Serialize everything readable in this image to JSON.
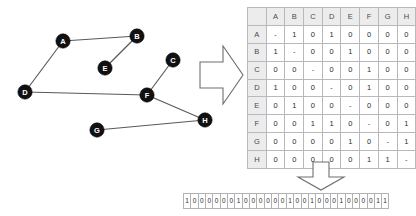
{
  "graph": {
    "title": "undirected-graph",
    "node_fill_color": "#111114",
    "node_label_color": "#ffffff",
    "edge_color": "#59595b",
    "nodes": [
      {
        "id": "A",
        "label": "A",
        "x": 63,
        "y": 41
      },
      {
        "id": "B",
        "label": "B",
        "x": 137,
        "y": 36
      },
      {
        "id": "C",
        "label": "C",
        "x": 173,
        "y": 60
      },
      {
        "id": "D",
        "label": "D",
        "x": 25,
        "y": 92
      },
      {
        "id": "E",
        "label": "E",
        "x": 105,
        "y": 68
      },
      {
        "id": "F",
        "label": "F",
        "x": 147,
        "y": 95
      },
      {
        "id": "G",
        "label": "G",
        "x": 97,
        "y": 130
      },
      {
        "id": "H",
        "label": "H",
        "x": 205,
        "y": 120
      }
    ],
    "edges": [
      {
        "from": "A",
        "to": "B"
      },
      {
        "from": "A",
        "to": "D"
      },
      {
        "from": "B",
        "to": "E"
      },
      {
        "from": "C",
        "to": "F"
      },
      {
        "from": "D",
        "to": "F"
      },
      {
        "from": "F",
        "to": "H"
      },
      {
        "from": "G",
        "to": "H"
      }
    ]
  },
  "arrows": {
    "right_arrow": "block-arrow-right",
    "down_arrow": "block-arrow-down"
  },
  "matrix": {
    "corner_label": "",
    "column_headers": [
      "A",
      "B",
      "C",
      "D",
      "E",
      "F",
      "G",
      "H"
    ],
    "row_headers": [
      "A",
      "B",
      "C",
      "D",
      "E",
      "F",
      "G",
      "H"
    ],
    "rows": [
      [
        "-",
        "1",
        "0",
        "1",
        "0",
        "0",
        "0",
        "0"
      ],
      [
        "1",
        "-",
        "0",
        "0",
        "1",
        "0",
        "0",
        "0"
      ],
      [
        "0",
        "0",
        "-",
        "0",
        "0",
        "1",
        "0",
        "0"
      ],
      [
        "1",
        "0",
        "0",
        "-",
        "0",
        "1",
        "0",
        "0"
      ],
      [
        "0",
        "1",
        "0",
        "0",
        "-",
        "0",
        "0",
        "0"
      ],
      [
        "0",
        "0",
        "1",
        "1",
        "0",
        "-",
        "0",
        "1"
      ],
      [
        "0",
        "0",
        "0",
        "0",
        "1",
        "0",
        "-",
        "1"
      ],
      [
        "0",
        "0",
        "0",
        "0",
        "0",
        "1",
        "1",
        "-"
      ]
    ]
  },
  "bitstring": {
    "bits": [
      "1",
      "0",
      "0",
      "0",
      "0",
      "0",
      "0",
      "1",
      "0",
      "0",
      "0",
      "0",
      "0",
      "0",
      "1",
      "0",
      "0",
      "1",
      "0",
      "0",
      "0",
      "1",
      "0",
      "0",
      "0",
      "0",
      "1",
      "1"
    ],
    "value": "1000000100000010010001000011",
    "length": 28
  }
}
